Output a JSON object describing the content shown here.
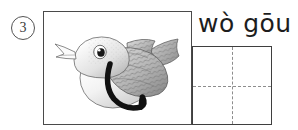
{
  "exercise": {
    "number": "3",
    "number_icon": "circled-number-icon"
  },
  "picture": {
    "caption": "",
    "subject": "bird",
    "icon": "bird-illustration-icon",
    "stroke_overlay": "wo-gou-stroke-icon",
    "description": "grayscale bird drawing with thick black reclining-hook stroke"
  },
  "pinyin": {
    "text": "wò gōu",
    "syllables": [
      "wò",
      "gōu"
    ]
  },
  "writing_grid": {
    "type": "tian-zi-ge",
    "cell_value": "",
    "guide_lines": [
      "vertical-center",
      "horizontal-center"
    ],
    "line_style": "dashed"
  },
  "colors": {
    "frame_border": "#4a4a4a",
    "grid_border": "#3f3f3f",
    "guide_line": "#8d8d8d",
    "text": "#1d1d1d",
    "stroke_black": "#111111",
    "page_background": "#ffffff"
  }
}
